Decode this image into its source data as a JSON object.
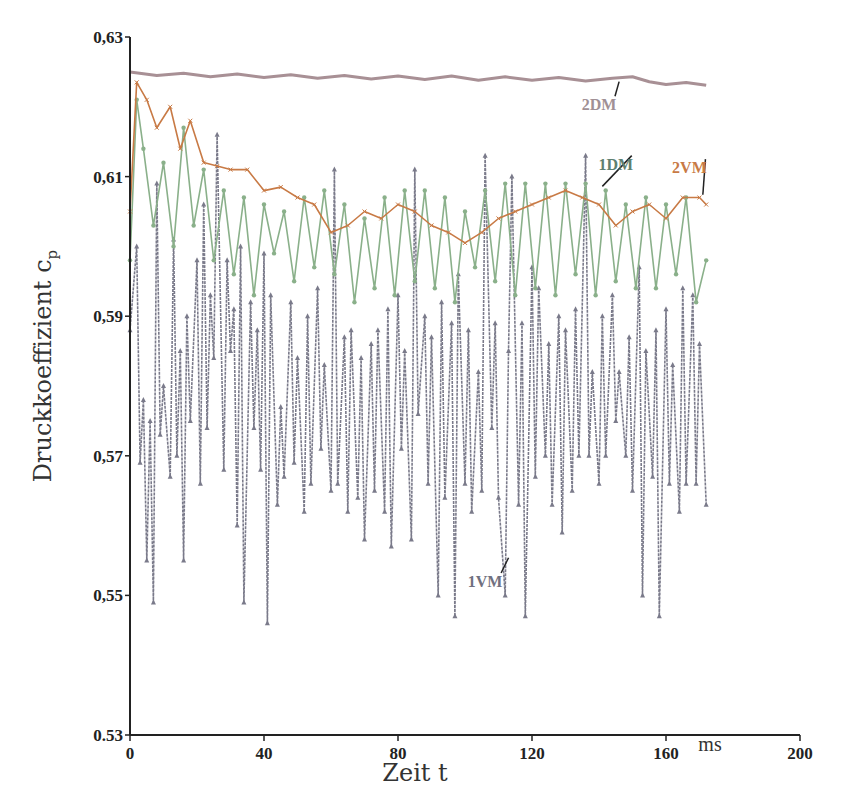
{
  "chart_data": {
    "type": "line",
    "title": "",
    "xlabel": "Zeit t",
    "xunit": "ms",
    "ylabel": "Druckkoeffizient c",
    "ylabel_subscript": "p",
    "xlim": [
      0,
      200
    ],
    "ylim": [
      0.53,
      0.63
    ],
    "x_ticks": [
      0,
      40,
      80,
      120,
      160,
      200
    ],
    "x_tick_labels": [
      "0",
      "40",
      "80",
      "120",
      "160",
      "200"
    ],
    "y_ticks": [
      0.53,
      0.55,
      0.57,
      0.59,
      0.61,
      0.63
    ],
    "y_tick_labels": [
      "0.53",
      "0,55",
      "0,57",
      "0,59",
      "0,61",
      "0,63"
    ],
    "grid": false,
    "legend": "inline labels",
    "series": [
      {
        "name": "2DM",
        "color": "#a89095",
        "marker": "dot",
        "x": [
          0,
          8,
          16,
          24,
          32,
          40,
          48,
          56,
          64,
          72,
          80,
          88,
          96,
          104,
          112,
          120,
          128,
          136,
          144,
          150,
          155,
          160,
          166,
          172
        ],
        "values": [
          0.625,
          0.6245,
          0.6248,
          0.6243,
          0.6247,
          0.6242,
          0.6246,
          0.6241,
          0.6245,
          0.624,
          0.6244,
          0.6239,
          0.6244,
          0.6238,
          0.6243,
          0.6238,
          0.6242,
          0.6237,
          0.6241,
          0.6243,
          0.6236,
          0.6232,
          0.6235,
          0.6231
        ]
      },
      {
        "name": "2VM",
        "color": "#c87a45",
        "marker": "x",
        "x": [
          0,
          2,
          5,
          8,
          12,
          15,
          18,
          22,
          26,
          30,
          35,
          40,
          45,
          50,
          55,
          60,
          65,
          70,
          75,
          80,
          85,
          90,
          95,
          100,
          105,
          110,
          115,
          120,
          125,
          130,
          135,
          140,
          145,
          150,
          155,
          160,
          165,
          170,
          172
        ],
        "values": [
          0.605,
          0.6235,
          0.621,
          0.617,
          0.62,
          0.614,
          0.618,
          0.612,
          0.6115,
          0.611,
          0.611,
          0.608,
          0.6085,
          0.607,
          0.606,
          0.602,
          0.603,
          0.605,
          0.604,
          0.606,
          0.605,
          0.603,
          0.602,
          0.6005,
          0.602,
          0.604,
          0.605,
          0.606,
          0.607,
          0.608,
          0.607,
          0.606,
          0.603,
          0.605,
          0.606,
          0.604,
          0.607,
          0.607,
          0.606
        ]
      },
      {
        "name": "1DM",
        "color": "#8ab08a",
        "marker": "star",
        "x": [
          0,
          2,
          4,
          7,
          10,
          13,
          16,
          19,
          22,
          25,
          28,
          31,
          34,
          37,
          40,
          43,
          46,
          49,
          52,
          55,
          58,
          61,
          64,
          67,
          70,
          73,
          76,
          79,
          82,
          85,
          88,
          91,
          94,
          97,
          100,
          103,
          106,
          109,
          112,
          115,
          118,
          121,
          124,
          127,
          130,
          133,
          136,
          139,
          142,
          145,
          148,
          151,
          154,
          157,
          160,
          163,
          166,
          169,
          172
        ],
        "values": [
          0.598,
          0.621,
          0.614,
          0.603,
          0.612,
          0.6,
          0.617,
          0.603,
          0.611,
          0.598,
          0.608,
          0.596,
          0.607,
          0.593,
          0.606,
          0.599,
          0.605,
          0.595,
          0.607,
          0.597,
          0.608,
          0.596,
          0.606,
          0.592,
          0.604,
          0.594,
          0.607,
          0.593,
          0.608,
          0.595,
          0.608,
          0.594,
          0.607,
          0.592,
          0.605,
          0.597,
          0.608,
          0.595,
          0.609,
          0.593,
          0.609,
          0.594,
          0.609,
          0.593,
          0.609,
          0.596,
          0.609,
          0.593,
          0.608,
          0.595,
          0.606,
          0.594,
          0.607,
          0.594,
          0.606,
          0.596,
          0.607,
          0.592,
          0.598
        ]
      },
      {
        "name": "1VM",
        "color": "#7a7a8a",
        "marker": "triangle",
        "x": [
          0,
          2,
          3,
          4,
          5,
          6,
          7,
          8,
          9,
          10,
          12,
          13,
          14,
          15,
          16,
          17,
          18,
          20,
          21,
          22,
          23,
          24,
          25,
          26,
          28,
          29,
          30,
          31,
          32,
          33,
          34,
          36,
          37,
          38,
          39,
          40,
          41,
          42,
          44,
          45,
          46,
          48,
          49,
          50,
          52,
          53,
          54,
          56,
          57,
          58,
          60,
          61,
          62,
          64,
          65,
          66,
          68,
          69,
          70,
          72,
          73,
          74,
          76,
          77,
          78,
          80,
          81,
          82,
          84,
          85,
          86,
          88,
          89,
          90,
          92,
          93,
          94,
          96,
          97,
          98,
          100,
          101,
          102,
          104,
          105,
          106,
          108,
          109,
          110,
          112,
          113,
          114,
          116,
          117,
          118,
          120,
          121,
          122,
          124,
          125,
          126,
          128,
          129,
          130,
          132,
          133,
          134,
          136,
          137,
          138,
          140,
          141,
          142,
          144,
          145,
          146,
          148,
          149,
          150,
          152,
          153,
          154,
          156,
          157,
          158,
          160,
          161,
          162,
          164,
          165,
          166,
          168,
          169,
          170,
          172
        ],
        "values": [
          0.588,
          0.6,
          0.569,
          0.578,
          0.555,
          0.575,
          0.549,
          0.609,
          0.573,
          0.58,
          0.567,
          0.601,
          0.57,
          0.585,
          0.555,
          0.59,
          0.575,
          0.598,
          0.566,
          0.606,
          0.574,
          0.593,
          0.584,
          0.616,
          0.568,
          0.598,
          0.585,
          0.591,
          0.56,
          0.6,
          0.549,
          0.592,
          0.574,
          0.588,
          0.568,
          0.599,
          0.546,
          0.593,
          0.563,
          0.577,
          0.567,
          0.592,
          0.569,
          0.584,
          0.562,
          0.59,
          0.566,
          0.594,
          0.571,
          0.583,
          0.565,
          0.611,
          0.566,
          0.587,
          0.562,
          0.588,
          0.564,
          0.584,
          0.558,
          0.586,
          0.565,
          0.588,
          0.562,
          0.591,
          0.557,
          0.593,
          0.571,
          0.585,
          0.558,
          0.611,
          0.576,
          0.59,
          0.566,
          0.587,
          0.55,
          0.592,
          0.564,
          0.589,
          0.547,
          0.596,
          0.566,
          0.588,
          0.562,
          0.582,
          0.565,
          0.613,
          0.574,
          0.589,
          0.564,
          0.55,
          0.585,
          0.61,
          0.563,
          0.589,
          0.547,
          0.597,
          0.567,
          0.594,
          0.57,
          0.586,
          0.563,
          0.59,
          0.559,
          0.588,
          0.565,
          0.591,
          0.57,
          0.613,
          0.57,
          0.582,
          0.566,
          0.59,
          0.57,
          0.593,
          0.575,
          0.582,
          0.57,
          0.587,
          0.565,
          0.597,
          0.55,
          0.585,
          0.567,
          0.588,
          0.547,
          0.591,
          0.566,
          0.583,
          0.562,
          0.594,
          0.566,
          0.593,
          0.566,
          0.586,
          0.563
        ]
      }
    ],
    "annotations": [
      {
        "label": "2DM",
        "x_label": 140,
        "y_label": 0.6195,
        "x_point": 146,
        "y_point": 0.6236,
        "color": "#a09095"
      },
      {
        "label": "1DM",
        "x_label": 145,
        "y_label": 0.611,
        "x_point": 141,
        "y_point": 0.6086,
        "color": "#5e8070"
      },
      {
        "label": "2VM",
        "x_label": 167,
        "y_label": 0.6105,
        "x_point": 171,
        "y_point": 0.6074,
        "color": "#c87a45"
      },
      {
        "label": "1VM",
        "x_label": 106,
        "y_label": 0.5512,
        "x_point": 113,
        "y_point": 0.5554,
        "color": "#707080"
      }
    ]
  }
}
